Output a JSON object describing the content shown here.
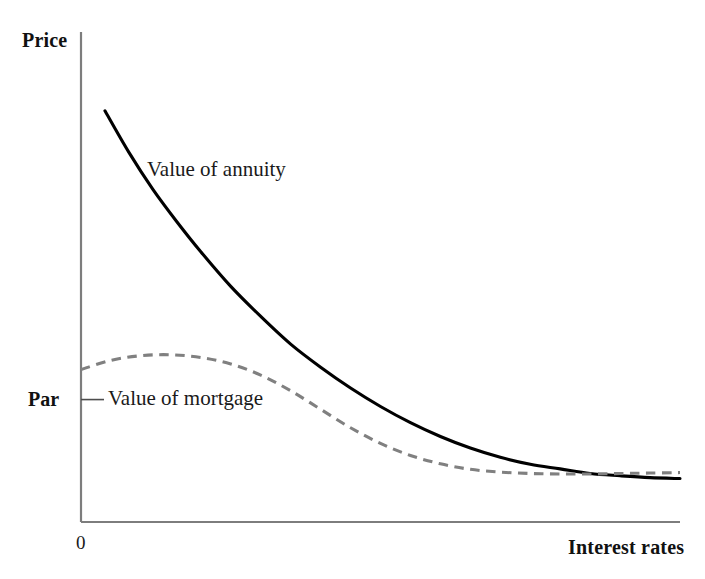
{
  "figure": {
    "background_color": "#ffffff",
    "axis_color": "#7d7d7d",
    "y_axis_title": "Price",
    "x_axis_title": "Interest rates",
    "origin_label": "0",
    "par_tick_label": "Par"
  },
  "chart_data": {
    "type": "line",
    "title": "",
    "subtitle": "",
    "xlabel": "Interest rates",
    "ylabel": "Price",
    "xlim": [
      0,
      100
    ],
    "ylim": [
      0,
      100
    ],
    "grid": false,
    "legend_position": "inline-annotations",
    "x_tick_labels": [
      "0"
    ],
    "y_tick_labels": [
      "Par"
    ],
    "annotations": [
      {
        "text": "Value of annuity",
        "x": 14.5,
        "y": 76.5
      },
      {
        "text": "Value of mortgage",
        "x": 6.0,
        "y": 29.5
      }
    ],
    "series": [
      {
        "name": "Value of annuity",
        "style": "solid",
        "color": "#000000",
        "x": [
          4,
          8,
          12,
          16,
          20,
          25,
          30,
          35,
          40,
          45,
          50,
          55,
          60,
          65,
          70,
          75,
          80,
          85,
          90,
          95,
          100
        ],
        "y": [
          89,
          80,
          72,
          65,
          58.5,
          51,
          44.5,
          38.5,
          33.5,
          29,
          25,
          21.5,
          18.5,
          16,
          14,
          12.5,
          11.5,
          10.5,
          10,
          9.6,
          9.4
        ]
      },
      {
        "name": "Value of mortgage",
        "style": "dashed",
        "color": "#808080",
        "x": [
          0,
          5,
          10,
          15,
          20,
          25,
          30,
          35,
          40,
          45,
          50,
          55,
          60,
          65,
          70,
          75,
          80,
          85,
          90,
          95,
          100
        ],
        "y": [
          33,
          35,
          36,
          36.2,
          35.6,
          34.2,
          31.8,
          28.4,
          24.4,
          20.4,
          17,
          14.4,
          12.6,
          11.4,
          10.8,
          10.5,
          10.4,
          10.4,
          10.5,
          10.6,
          10.7
        ]
      }
    ],
    "crossovers": [
      {
        "note": "mortgage falls below annuity",
        "x": 37
      },
      {
        "note": "mortgage rises above annuity",
        "x": 69
      }
    ],
    "par_level_y": 26.5
  }
}
